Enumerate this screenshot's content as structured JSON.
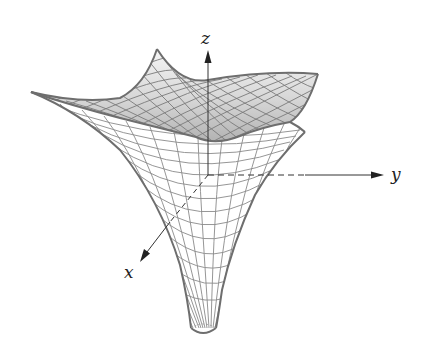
{
  "figure": {
    "type": "3d-surface-wireframe",
    "axes": {
      "x": {
        "label": "x"
      },
      "y": {
        "label": "y"
      },
      "z": {
        "label": "z"
      }
    },
    "colors": {
      "mesh_line": "#7a7a7a",
      "outline": "#6e6e6e",
      "top_fill_light": "#f4f4f4",
      "top_fill_dark": "#b9b9b9",
      "axis": "#333333",
      "background": "#ffffff"
    }
  }
}
